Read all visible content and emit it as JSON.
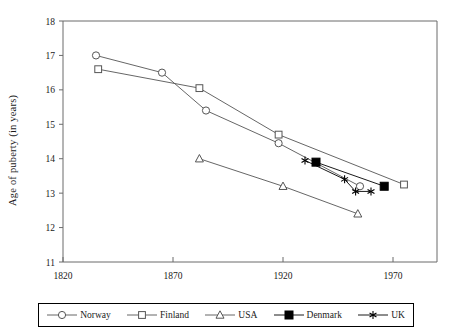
{
  "chart_data": {
    "type": "line",
    "title": "",
    "xlabel": "",
    "ylabel": "Age of puberty (in years)",
    "xlim": [
      1820,
      1990
    ],
    "ylim": [
      11,
      18
    ],
    "xticks": [
      1820,
      1870,
      1920,
      1970
    ],
    "yticks": [
      11,
      12,
      13,
      14,
      15,
      16,
      17,
      18
    ],
    "grid": false,
    "legend_position": "bottom",
    "series": [
      {
        "name": "Norway",
        "marker": "circle-open",
        "color": "#555555",
        "points": [
          {
            "x": 1835,
            "y": 17.0
          },
          {
            "x": 1865,
            "y": 16.5
          },
          {
            "x": 1885,
            "y": 15.4
          },
          {
            "x": 1918,
            "y": 14.45
          },
          {
            "x": 1955,
            "y": 13.2
          }
        ]
      },
      {
        "name": "Finland",
        "marker": "square-open",
        "color": "#555555",
        "points": [
          {
            "x": 1836,
            "y": 16.6
          },
          {
            "x": 1882,
            "y": 16.05
          },
          {
            "x": 1918,
            "y": 14.7
          },
          {
            "x": 1975,
            "y": 13.25
          }
        ]
      },
      {
        "name": "USA",
        "marker": "triangle-open",
        "color": "#555555",
        "points": [
          {
            "x": 1882,
            "y": 14.0
          },
          {
            "x": 1920,
            "y": 13.2
          },
          {
            "x": 1954,
            "y": 12.4
          }
        ]
      },
      {
        "name": "Denmark",
        "marker": "square-filled",
        "color": "#000000",
        "points": [
          {
            "x": 1935,
            "y": 13.9
          },
          {
            "x": 1966,
            "y": 13.2
          }
        ]
      },
      {
        "name": "UK",
        "marker": "asterisk",
        "color": "#000000",
        "points": [
          {
            "x": 1930,
            "y": 13.95
          },
          {
            "x": 1948,
            "y": 13.4
          },
          {
            "x": 1953,
            "y": 13.05
          },
          {
            "x": 1960,
            "y": 13.05
          }
        ]
      }
    ]
  },
  "legend": {
    "items": [
      {
        "label": "Norway",
        "marker": "circle-open"
      },
      {
        "label": "Finland",
        "marker": "square-open"
      },
      {
        "label": "USA",
        "marker": "triangle-open"
      },
      {
        "label": "Denmark",
        "marker": "square-filled"
      },
      {
        "label": "UK",
        "marker": "asterisk"
      }
    ]
  },
  "axis": {
    "ylabel": "Age of puberty (in years)",
    "ytick_labels": [
      "18",
      "17",
      "16",
      "15",
      "14",
      "13",
      "12",
      "11"
    ],
    "xtick_labels": [
      "1820",
      "1870",
      "1920",
      "1970"
    ]
  },
  "colors": {
    "axis": "#6b6b6b",
    "line": "#666666",
    "dark": "#000000",
    "background": "#ffffff"
  }
}
